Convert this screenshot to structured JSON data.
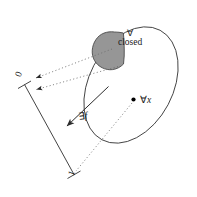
{
  "figure": {
    "labels": {
      "closed_quantifier": "∀",
      "closed_word": "closed",
      "forall_x_quantifier": "∀",
      "forall_x_variable": "x",
      "exists_f_quantifier": "∃",
      "exists_f_variable": "f",
      "interval_start": "0",
      "interval_end": "1"
    },
    "colors": {
      "stroke": "#3a3a3a",
      "blob_fill": "#969696",
      "blob_stroke": "#4a4a4a",
      "dotted": "#6e6e6e",
      "dot": "#000000",
      "background": "#ffffff",
      "text": "#1a1a1a"
    },
    "elements": {
      "domain_ellipse_name": "domain-ellipse",
      "closed_subset_name": "closed-subset-blob",
      "interval_name": "unit-interval-segment",
      "point_name": "forall-x-point",
      "map_arrow_name": "exists-f-arrow"
    },
    "geometry": {
      "ellipse": {
        "cx": 131,
        "cy": 85,
        "rx": 42,
        "ry": 62,
        "rotate_deg": 28
      },
      "interval": {
        "x1": 24,
        "y1": 84,
        "x2": 74,
        "y2": 175
      },
      "point": {
        "x": 133,
        "y": 100,
        "r": 2.1
      }
    },
    "mappings": [
      {
        "from": "closed-subset-blob",
        "to": "interval-upper-region",
        "style": "dotted",
        "arrow": "end"
      },
      {
        "from": "closed-subset-blob-lower",
        "to": "interval-upper-region",
        "style": "dotted",
        "arrow": "end"
      },
      {
        "from": "forall-x-point",
        "to": "interval-lower-end",
        "style": "dotted",
        "arrow": "end"
      }
    ]
  }
}
